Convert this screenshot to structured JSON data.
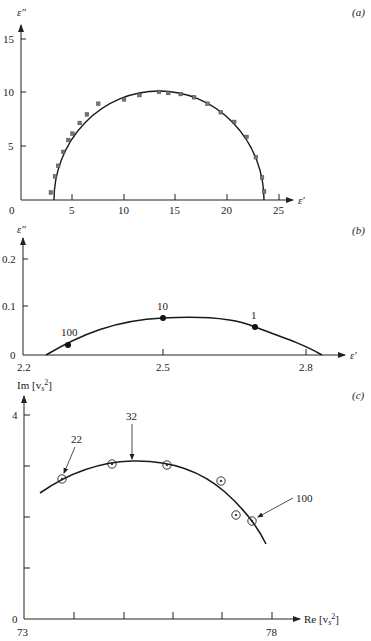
{
  "chart_data": [
    {
      "panel": "(a)",
      "type": "scatter",
      "xlabel": "ε′",
      "ylabel": "ε″",
      "xlim": [
        0,
        26
      ],
      "ylim": [
        0,
        17
      ],
      "xticks": [
        0,
        5,
        10,
        15,
        20,
        25
      ],
      "yticks": [
        5,
        10,
        15
      ],
      "grid": false,
      "series": [
        {
          "name": "measured",
          "marker": "square",
          "x": [
            2.9,
            3.3,
            3.6,
            4.1,
            4.6,
            5.0,
            5.7,
            6.4,
            7.5,
            10.0,
            11.5,
            13.4,
            14.3,
            15.5,
            16.8,
            18.1,
            19.4,
            20.7,
            21.9,
            22.8,
            23.4,
            23.6
          ],
          "y": [
            0.7,
            2.2,
            3.2,
            4.5,
            5.6,
            6.2,
            7.2,
            8.0,
            9.0,
            9.4,
            9.8,
            10.1,
            10.0,
            9.9,
            9.6,
            9.0,
            8.2,
            7.3,
            5.9,
            4.0,
            2.1,
            0.8
          ]
        },
        {
          "name": "fit (semicircle)",
          "type": "line",
          "center_x": 13.4,
          "radius": 10.2,
          "eps_inf": 3.2,
          "eps_s": 23.6,
          "peak": 10.2
        }
      ]
    },
    {
      "panel": "(b)",
      "type": "line",
      "xlabel": "ε′",
      "ylabel": "ε″",
      "xlim": [
        2.2,
        2.85
      ],
      "ylim": [
        0,
        0.25
      ],
      "xticks": [
        2.2,
        2.5,
        2.8
      ],
      "yticks": [
        0,
        0.1,
        0.2
      ],
      "grid": false,
      "series": [
        {
          "name": "curve",
          "x": [
            2.25,
            2.295,
            2.4,
            2.5,
            2.55,
            2.6,
            2.686,
            2.75,
            2.83
          ],
          "y": [
            0.0,
            0.021,
            0.058,
            0.076,
            0.078,
            0.075,
            0.057,
            0.036,
            0.0
          ]
        },
        {
          "name": "labeled points",
          "marker": "filled-circle",
          "x": [
            2.295,
            2.5,
            2.686
          ],
          "y": [
            0.021,
            0.076,
            0.057
          ],
          "labels": [
            "100",
            "10",
            "1"
          ]
        }
      ]
    },
    {
      "panel": "(c)",
      "type": "scatter",
      "xlabel": "Re [v_s²]",
      "ylabel": "Im [v_s²]",
      "xlim": [
        73,
        78.6
      ],
      "ylim": [
        0,
        4.5
      ],
      "xticks": [
        73,
        74,
        75,
        76,
        77,
        78
      ],
      "xtick_labels": [
        "73",
        "",
        "",
        "",
        "",
        "78"
      ],
      "yticks": [
        0,
        1,
        2,
        3,
        4
      ],
      "ytick_labels": [
        "0",
        "",
        "",
        "",
        "4"
      ],
      "grid": false,
      "series": [
        {
          "name": "measured",
          "marker": "circled-dot",
          "x": [
            73.77,
            74.77,
            75.88,
            76.97,
            77.27,
            77.6
          ],
          "y": [
            2.75,
            3.04,
            3.02,
            2.71,
            2.04,
            1.92
          ]
        },
        {
          "name": "fit curve",
          "type": "line",
          "x": [
            73.32,
            73.8,
            74.4,
            75.0,
            75.6,
            76.2,
            76.8,
            77.3,
            77.6,
            77.9
          ],
          "y": [
            2.47,
            2.78,
            2.98,
            3.05,
            3.01,
            2.85,
            2.57,
            2.21,
            1.9,
            1.47
          ]
        }
      ],
      "annotations": [
        {
          "text": "22",
          "points_to": [
            73.77,
            2.75
          ]
        },
        {
          "text": "32",
          "points_to": [
            75.2,
            3.05
          ]
        },
        {
          "text": "100",
          "points_to": [
            77.6,
            1.92
          ]
        }
      ]
    }
  ],
  "labels": {
    "panel_a": "(a)",
    "panel_b": "(b)",
    "panel_c": "(c)",
    "a_ylabel": "ε″",
    "a_xlabel": "ε′",
    "a_xticks": [
      "0",
      "5",
      "10",
      "15",
      "20",
      "25"
    ],
    "a_yticks": [
      "5",
      "10",
      "15"
    ],
    "b_ylabel": "ε″",
    "b_xlabel": "ε′",
    "b_xticks": [
      "2.2",
      "2.5",
      "2.8"
    ],
    "b_yticks": [
      "0",
      "0.1",
      "0.2"
    ],
    "b_point_labels": [
      "100",
      "10",
      "1"
    ],
    "c_ylabel": "Im [v",
    "c_xlabel": "Re [v",
    "c_sub": "s",
    "c_sup": "2",
    "c_close": "]",
    "c_xticks": [
      "73",
      "78"
    ],
    "c_yticks": [
      "0",
      "4"
    ],
    "c_annotations": [
      "22",
      "32",
      "100"
    ]
  }
}
